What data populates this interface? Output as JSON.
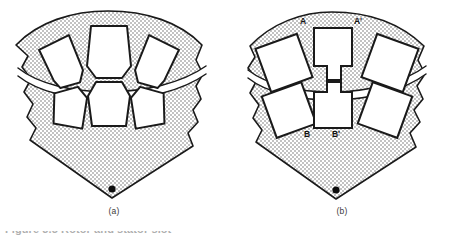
{
  "figure": {
    "domain": "Diagram",
    "caption_clipped": "Figure 3.5 Rotor and stator slot",
    "background_color": "#ffffff",
    "fill_color": "#c9c9c9",
    "outline_color": "#1a1a1a",
    "slot_fill_color": "#ffffff",
    "label_color": "#111111"
  },
  "panels": [
    {
      "id": "a",
      "subcaption": "(a)",
      "slot_shape": "trapezoidal",
      "slot_count": 6,
      "stator_slots": 3,
      "rotor_slots": 3,
      "has_airgap_arc": true,
      "has_shaft_center_dot": true,
      "labels": []
    },
    {
      "id": "b",
      "subcaption": "(b)",
      "slot_shape": "rectangular",
      "slot_count": 6,
      "stator_slots": 3,
      "rotor_slots": 3,
      "has_airgap_arc": true,
      "has_shaft_center_dot": true,
      "labels": [
        {
          "name": "label-a",
          "text": "A",
          "x": 75,
          "y": 20
        },
        {
          "name": "label-a-prime",
          "text": "A'",
          "x": 129,
          "y": 20
        },
        {
          "name": "label-b",
          "text": "B",
          "x": 77,
          "y": 130
        },
        {
          "name": "label-b-prime",
          "text": "B'",
          "x": 106,
          "y": 130
        }
      ]
    }
  ]
}
